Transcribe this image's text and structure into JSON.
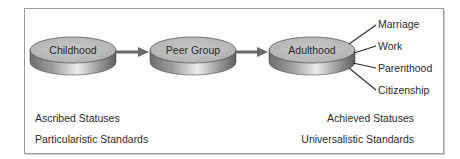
{
  "diagram": {
    "stages": [
      {
        "label": "Childhood"
      },
      {
        "label": "Peer Group"
      },
      {
        "label": "Adulthood"
      }
    ],
    "adulthood_branches": [
      {
        "label": "Marriage"
      },
      {
        "label": "Work"
      },
      {
        "label": "Parenthood"
      },
      {
        "label": "Citizenship"
      }
    ],
    "left_notes": {
      "line1": "Ascribed Statuses",
      "line2": "Particularistic Standards"
    },
    "right_notes": {
      "line1": "Achieved Statuses",
      "line2": "Universalistic Standards"
    },
    "colors": {
      "disk_top": "#bdbdbd",
      "disk_side_dark": "#6e6e6e",
      "disk_side_light": "#e6e6e6",
      "arrow": "#6a6a6a",
      "frame_border": "#9a9a9a",
      "text": "#2b2b2b"
    }
  }
}
